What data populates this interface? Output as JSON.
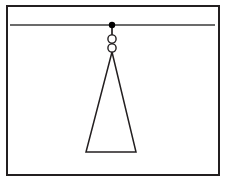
{
  "figure": {
    "canvas": {
      "width": 226,
      "height": 181,
      "background": "#ffffff"
    },
    "colors": {
      "stroke": "#231f20",
      "frame_stroke": "#231f20",
      "support_stroke": "#3a3a3a",
      "fill_white": "#ffffff",
      "pivot_fill": "#000000"
    },
    "frame": {
      "label": "outer border",
      "x": 7,
      "y": 6,
      "width": 212,
      "height": 169,
      "stroke_width": 2
    },
    "support_line": {
      "label": "horizontal ceiling support",
      "x1": 10,
      "y1": 25,
      "x2": 215,
      "y2": 25,
      "stroke_width": 1.4
    },
    "pivot": {
      "label": "pivot point",
      "cx": 112,
      "cy": 25,
      "r": 3.2
    },
    "links": [
      {
        "label": "upper ring link",
        "cx": 112,
        "cy": 39,
        "r": 4.1,
        "stroke_width": 1.4
      },
      {
        "label": "lower ring link",
        "cx": 112,
        "cy": 48,
        "r": 4.1,
        "stroke_width": 1.4
      }
    ],
    "rods": [
      {
        "label": "pivot to upper ring rod",
        "x1": 112,
        "y1": 25,
        "x2": 112,
        "y2": 35,
        "stroke_width": 1.6
      },
      {
        "label": "upper ring to lower ring rod",
        "x1": 112,
        "y1": 43,
        "x2": 112,
        "y2": 44,
        "stroke_width": 1.6
      }
    ],
    "triangle": {
      "label": "suspended triangular body",
      "apex": {
        "x": 112,
        "y": 52
      },
      "base_left": {
        "x": 86,
        "y": 152
      },
      "base_right": {
        "x": 136,
        "y": 152
      },
      "points": "112,52 86,152 136,152",
      "stroke_width": 1.5
    }
  }
}
